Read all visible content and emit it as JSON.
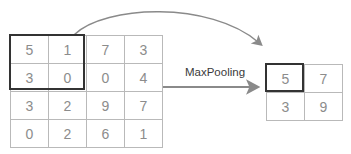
{
  "figure": {
    "operation_label": "MaxPooling",
    "colors": {
      "grid_line": "#b9b9b9",
      "digit_text": "#8c8c8c",
      "highlight_border": "#333333",
      "arrow": "#8a8a8a",
      "label_text": "#3a3a3a",
      "background": "#ffffff"
    }
  },
  "input_matrix": {
    "name": "input-feature-map",
    "rows": 4,
    "cols": 4,
    "values": [
      [
        "5",
        "1",
        "7",
        "3"
      ],
      [
        "3",
        "0",
        "0",
        "4"
      ],
      [
        "3",
        "2",
        "9",
        "7"
      ],
      [
        "0",
        "2",
        "6",
        "1"
      ]
    ],
    "highlight": {
      "label": "pooling-window",
      "row_start": 0,
      "col_start": 0,
      "rows": 2,
      "cols": 2,
      "values": [
        [
          "5",
          "1"
        ],
        [
          "3",
          "0"
        ]
      ]
    }
  },
  "output_matrix": {
    "name": "pooled-output",
    "rows": 2,
    "cols": 2,
    "values": [
      [
        "5",
        "7"
      ],
      [
        "3",
        "9"
      ]
    ],
    "highlight": {
      "label": "pooled-cell",
      "row": 0,
      "col": 0,
      "value": "5"
    }
  },
  "arrows": [
    {
      "name": "mapping-arrow",
      "kind": "curved",
      "from": "input window top edge",
      "to": "output highlighted cell"
    },
    {
      "name": "operation-arrow",
      "kind": "straight",
      "from": "input matrix",
      "to": "output matrix",
      "label": "MaxPooling"
    }
  ]
}
